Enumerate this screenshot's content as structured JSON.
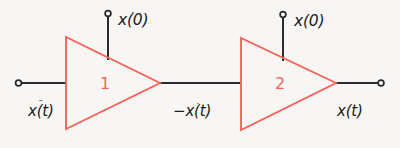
{
  "figure": {
    "type": "block-diagram",
    "background_color": "#f8f6f4",
    "block_color": "#f4645a",
    "wire_color": "#2b2b2b",
    "text_color": "#1b1b1b"
  },
  "blocks": [
    {
      "id": "amp1",
      "label": "1",
      "shape": "triangle-right"
    },
    {
      "id": "amp2",
      "label": "2",
      "shape": "triangle-right"
    }
  ],
  "labels": {
    "input_signal": "x(t)",
    "input_signal_dots": "¨",
    "initial_condition_1": "x(0)",
    "initial_condition_1_dots": "·",
    "middle_signal_sign": "−",
    "middle_signal": "x(t)",
    "middle_signal_dots": "·",
    "initial_condition_2": "x(0)",
    "initial_condition_2_dots": "",
    "output_signal": "x(t)",
    "output_signal_dots": ""
  },
  "terminals": [
    {
      "id": "input-terminal",
      "position": "left"
    },
    {
      "id": "ic1-terminal",
      "position": "top-left"
    },
    {
      "id": "ic2-terminal",
      "position": "top-right"
    },
    {
      "id": "output-terminal",
      "position": "right"
    }
  ]
}
